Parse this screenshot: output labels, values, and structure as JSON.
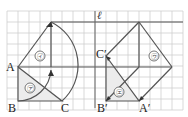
{
  "figure": {
    "type": "geometry-transformation-diagram",
    "grid": {
      "x0": 7,
      "y0": 11,
      "spacing": 11,
      "cols": 16,
      "rows": 9,
      "color": "#c8c8c8"
    },
    "line_l": {
      "label": "ℓ",
      "x": 95
    },
    "points": {
      "A": {
        "label": "A",
        "x": 18,
        "y": 67
      },
      "B": {
        "label": "B",
        "x": 18,
        "y": 101
      },
      "C": {
        "label": "C",
        "x": 62,
        "y": 101
      },
      "A_prime": {
        "label": "A′",
        "x": 139,
        "y": 101
      },
      "B_prime": {
        "label": "B′",
        "x": 106,
        "y": 101
      },
      "C_prime": {
        "label": "C′",
        "x": 106,
        "y": 56
      }
    },
    "regions": [
      {
        "label": "㋐",
        "name": "triangle-a",
        "x": 30,
        "y": 88
      },
      {
        "label": "㋑",
        "name": "triangle-i",
        "x": 40,
        "y": 56
      },
      {
        "label": "㋒",
        "name": "triangle-u",
        "x": 154,
        "y": 56
      },
      {
        "label": "㋓",
        "name": "triangle-e",
        "x": 119,
        "y": 92
      }
    ],
    "colors": {
      "line": "#555555",
      "shade": "#ececec"
    }
  }
}
